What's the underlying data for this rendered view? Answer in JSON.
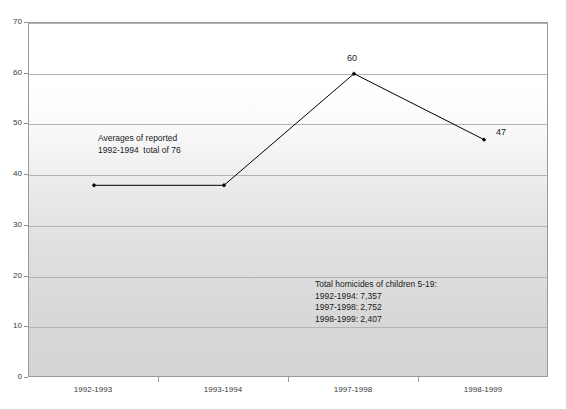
{
  "chart_data": {
    "type": "line",
    "title": "",
    "subtitle": "",
    "xlabel": "",
    "ylabel": "",
    "categories": [
      "1992-1993",
      "1993-1994",
      "1997-1998",
      "1998-1999"
    ],
    "values": [
      38,
      38,
      60,
      47
    ],
    "point_labels": [
      "",
      "",
      "60",
      "47"
    ],
    "ylim": [
      0,
      70
    ],
    "y_ticks": [
      0,
      10,
      20,
      30,
      40,
      50,
      60,
      70
    ],
    "y_tick_labels": [
      "0",
      "10",
      "20",
      "30",
      "40",
      "50",
      "60",
      "70"
    ],
    "grid": true,
    "legend": "none",
    "series": [
      {
        "name": "",
        "values": [
          38,
          38,
          60,
          47
        ],
        "line_color": "#000000",
        "marker_color": "#000000",
        "marker": "diamond"
      }
    ],
    "annotations": [
      {
        "name": "averages-note",
        "lines": [
          "Averages of reported",
          "1992-1994  total of 76"
        ],
        "text": "Averages of reported\n1992-1994  total of 76"
      },
      {
        "name": "totals-note",
        "lines": [
          "Total homicides of children 5-19:",
          "1992-1994: 7,357",
          "1997-1998: 2,752",
          "1998-1999: 2,407"
        ],
        "text": "Total homicides of children 5-19:\n1992-1994: 7,357\n1997-1998: 2,752\n1998-1999: 2,407"
      }
    ],
    "colors": {
      "plot_border": "#9a9a9a",
      "gridline": "#b3b3b3",
      "series_line": "#000000",
      "text": "#1a1a1a",
      "plot_background_top": "#ffffff",
      "plot_background_bottom": "#d5d5d5"
    }
  }
}
